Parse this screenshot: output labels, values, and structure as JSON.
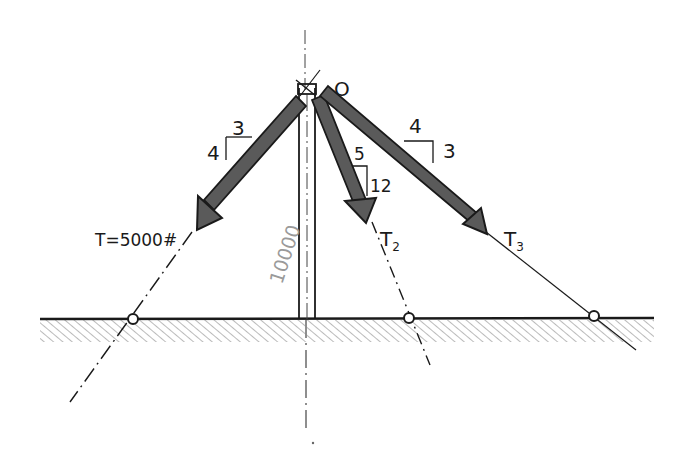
{
  "diagram": {
    "type": "statics free-body sketch",
    "point": {
      "label": "O"
    },
    "mast": {
      "load_label": "10000"
    },
    "cables": [
      {
        "name": "T1",
        "label": "T=5000#",
        "slope": {
          "rise": "4",
          "run": "3"
        }
      },
      {
        "name": "T2",
        "label_main": "T",
        "label_sub": "2",
        "slope": {
          "rise": "12",
          "run": "5"
        }
      },
      {
        "name": "T3",
        "label_main": "T",
        "label_sub": "3",
        "slope": {
          "rise": "3",
          "run": "4"
        }
      }
    ],
    "ground": {
      "style": "hatched"
    },
    "colors": {
      "ink": "#1a1a1a",
      "arrow_fill": "#555555",
      "hatch": "#8a8a8a",
      "faint_text": "#9a9a9a"
    }
  }
}
